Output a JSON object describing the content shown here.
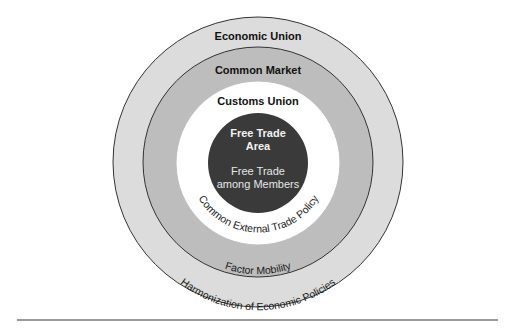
{
  "diagram": {
    "type": "concentric-circles",
    "colors": {
      "outer_ring": "#dcdcdc",
      "second_ring": "#bdbdbd",
      "third_ring": "#ffffff",
      "core": "#3a3a3a",
      "stroke": "#333333",
      "rule": "#9a9a9a"
    },
    "levels": [
      {
        "name": "Economic Union",
        "feature": "Harmonization of Economic Policies"
      },
      {
        "name": "Common Market",
        "feature": "Factor Mobility"
      },
      {
        "name": "Customs Union",
        "feature": "Common External Trade Policy"
      },
      {
        "name_line1": "Free Trade",
        "name_line2": "Area",
        "feature_line1": "Free Trade",
        "feature_line2": "among Members"
      }
    ]
  }
}
